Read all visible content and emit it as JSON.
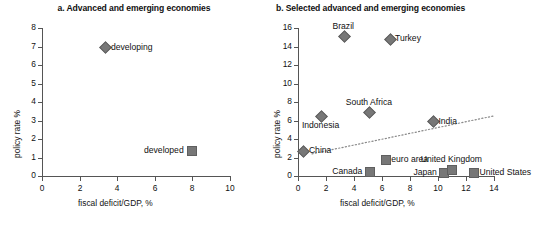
{
  "figure": {
    "width": 536,
    "height": 231,
    "marker_color": "#777777",
    "axis_color": "#555555",
    "trend_color": "#8a8a8a"
  },
  "chart_data": [
    {
      "type": "scatter",
      "panel": "a",
      "title": "a. Advanced and emerging economies",
      "xlabel": "fiscal deficit/GDP, %",
      "ylabel": "policy rate %",
      "xlim": [
        0,
        10
      ],
      "ylim": [
        0,
        8
      ],
      "xticks": [
        0,
        2,
        4,
        6,
        8,
        10
      ],
      "yticks": [
        0,
        1,
        2,
        3,
        4,
        5,
        6,
        7,
        8
      ],
      "grid": false,
      "legend": "none",
      "points": [
        {
          "label": "developing",
          "x": 3.35,
          "y": 7.0,
          "marker": "diamond",
          "label_pos": "right"
        },
        {
          "label": "developed",
          "x": 7.9,
          "y": 1.4,
          "marker": "square",
          "label_pos": "left"
        }
      ]
    },
    {
      "type": "scatter",
      "panel": "b",
      "title": "b. Selected advanced and emerging economies",
      "xlabel": "fiscal deficit/GDP, %",
      "ylabel": "policy rate %",
      "xlim": [
        0,
        14
      ],
      "ylim": [
        0,
        16
      ],
      "xticks": [
        0,
        2,
        4,
        6,
        8,
        10,
        12,
        14
      ],
      "yticks": [
        0,
        2,
        4,
        6,
        8,
        10,
        12,
        14,
        16
      ],
      "grid": false,
      "legend": "none",
      "trendline": {
        "x0": 1.0,
        "y0": 2.4,
        "x1": 14.0,
        "y1": 6.5,
        "style": "dotted"
      },
      "points": [
        {
          "label": "Brazil",
          "x": 3.25,
          "y": 15.2,
          "marker": "diamond",
          "label_pos": "above"
        },
        {
          "label": "Turkey",
          "x": 6.5,
          "y": 14.9,
          "marker": "diamond",
          "label_pos": "right"
        },
        {
          "label": "South Africa",
          "x": 5.05,
          "y": 7.0,
          "marker": "diamond",
          "label_pos": "above"
        },
        {
          "label": "India",
          "x": 9.6,
          "y": 6.0,
          "marker": "diamond",
          "label_pos": "right"
        },
        {
          "label": "Indonesia",
          "x": 1.6,
          "y": 6.5,
          "marker": "diamond",
          "label_pos": "below"
        },
        {
          "label": "China",
          "x": 0.35,
          "y": 2.8,
          "marker": "diamond",
          "label_pos": "right"
        },
        {
          "label": "euro area",
          "x": 6.2,
          "y": 1.8,
          "marker": "square",
          "label_pos": "right"
        },
        {
          "label": "Canada",
          "x": 5.05,
          "y": 0.55,
          "marker": "square",
          "label_pos": "left"
        },
        {
          "label": "Japan",
          "x": 10.35,
          "y": 0.4,
          "marker": "square",
          "label_pos": "left"
        },
        {
          "label": "United Kingdom",
          "x": 10.95,
          "y": 0.75,
          "marker": "square",
          "label_pos": "above"
        },
        {
          "label": "United States",
          "x": 12.5,
          "y": 0.4,
          "marker": "square",
          "label_pos": "right"
        }
      ]
    }
  ]
}
